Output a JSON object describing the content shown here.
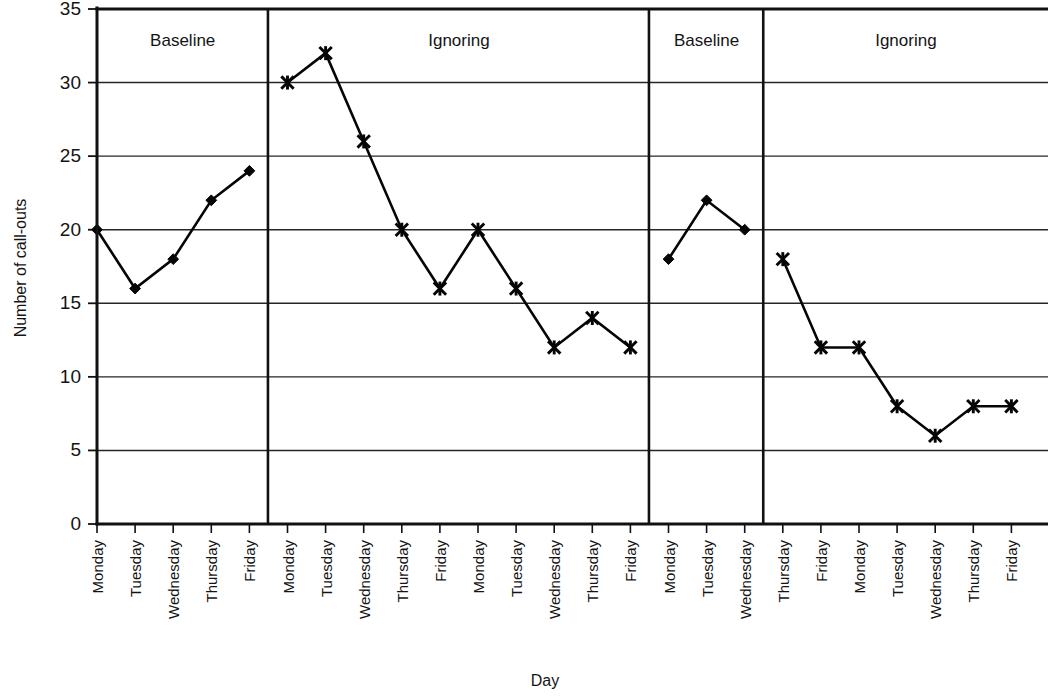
{
  "chart_data": {
    "type": "line",
    "title": "",
    "xlabel": "Day",
    "ylabel": "Number of call-outs",
    "ylim": [
      0,
      35
    ],
    "ytick_values": [
      0,
      5,
      10,
      15,
      20,
      25,
      30,
      35
    ],
    "ytick_labels": [
      "0",
      "5",
      "10",
      "15",
      "20",
      "25",
      "30",
      "35"
    ],
    "grid": "horizontal",
    "legend": "none",
    "x": [
      "Monday",
      "Tuesday",
      "Wednesday",
      "Thursday",
      "Friday",
      "Monday",
      "Tuesday",
      "Wednesday",
      "Thursday",
      "Friday",
      "Monday",
      "Tuesday",
      "Wednesday",
      "Thursday",
      "Friday",
      "Monday",
      "Tuesday",
      "Wednesday",
      "Thursday",
      "Friday",
      "Monday",
      "Tuesday",
      "Wednesday",
      "Thursday",
      "Friday"
    ],
    "values": [
      20,
      16,
      18,
      22,
      24,
      30,
      32,
      26,
      20,
      16,
      20,
      16,
      12,
      14,
      12,
      18,
      22,
      20,
      18,
      12,
      12,
      8,
      6,
      8,
      8
    ],
    "phases": [
      {
        "label": "Baseline",
        "marker": "diamond",
        "categories": [
          "Monday",
          "Tuesday",
          "Wednesday",
          "Thursday",
          "Friday"
        ],
        "values": [
          20,
          16,
          18,
          22,
          24
        ]
      },
      {
        "label": "Ignoring",
        "marker": "star",
        "categories": [
          "Monday",
          "Tuesday",
          "Wednesday",
          "Thursday",
          "Friday",
          "Monday",
          "Tuesday",
          "Wednesday",
          "Thursday",
          "Friday"
        ],
        "values": [
          30,
          32,
          26,
          20,
          16,
          20,
          16,
          12,
          14,
          12
        ]
      },
      {
        "label": "Baseline",
        "marker": "diamond",
        "categories": [
          "Monday",
          "Tuesday",
          "Wednesday"
        ],
        "values": [
          18,
          22,
          20
        ]
      },
      {
        "label": "Ignoring",
        "marker": "star",
        "categories": [
          "Thursday",
          "Friday",
          "Monday",
          "Tuesday",
          "Wednesday",
          "Thursday",
          "Friday"
        ],
        "values": [
          18,
          12,
          12,
          8,
          6,
          8,
          8
        ]
      }
    ],
    "colors": {
      "line": "#050505",
      "marker": "#050505",
      "grid": "#262626",
      "axis": "#111111",
      "background": "#ffffff"
    }
  },
  "axes": {
    "y_title": "Number of call-outs",
    "x_title": "Day"
  },
  "phase_labels": [
    {
      "text": "Baseline"
    },
    {
      "text": "Ignoring"
    },
    {
      "text": "Baseline"
    },
    {
      "text": "Ignoring"
    }
  ],
  "ytick_labels": [
    "0",
    "5",
    "10",
    "15",
    "20",
    "25",
    "30",
    "35"
  ],
  "xtick_labels": [
    "Monday",
    "Tuesday",
    "Wednesday",
    "Thursday",
    "Friday",
    "Monday",
    "Tuesday",
    "Wednesday",
    "Thursday",
    "Friday",
    "Monday",
    "Tuesday",
    "Wednesday",
    "Thursday",
    "Friday",
    "Monday",
    "Tuesday",
    "Wednesday",
    "Thursday",
    "Friday",
    "Monday",
    "Tuesday",
    "Wednesday",
    "Thursday",
    "Friday"
  ]
}
